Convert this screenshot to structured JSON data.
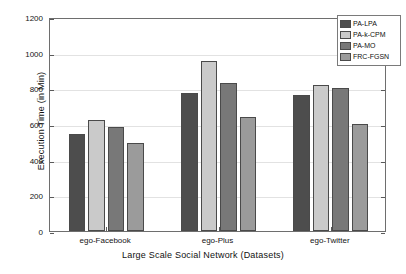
{
  "chart_data": {
    "type": "bar",
    "title": "",
    "xlabel": "Large Scale Social Network (Datasets)",
    "ylabel": "Execution Time (in Min)",
    "categories": [
      "ego-Facebook",
      "ego-Plus",
      "ego-Twitter"
    ],
    "series": [
      {
        "name": "PA-LPA",
        "color": "#4d4d4d",
        "values": [
          545,
          775,
          760
        ]
      },
      {
        "name": "PA-k-CPM",
        "color": "#cacaca",
        "values": [
          622,
          952,
          820
        ]
      },
      {
        "name": "PA-MO",
        "color": "#787878",
        "values": [
          585,
          828,
          802
        ]
      },
      {
        "name": "FRC-FGSN",
        "color": "#9b9b9b",
        "values": [
          495,
          640,
          600
        ]
      }
    ],
    "ylim": [
      0,
      1200
    ],
    "yticks": [
      0,
      200,
      400,
      600,
      800,
      1000,
      1200
    ],
    "ytick_labels": [
      "0",
      "200",
      "400",
      "600",
      "800",
      "1000",
      "1200"
    ],
    "grid": true,
    "legend_position": "top-right"
  }
}
